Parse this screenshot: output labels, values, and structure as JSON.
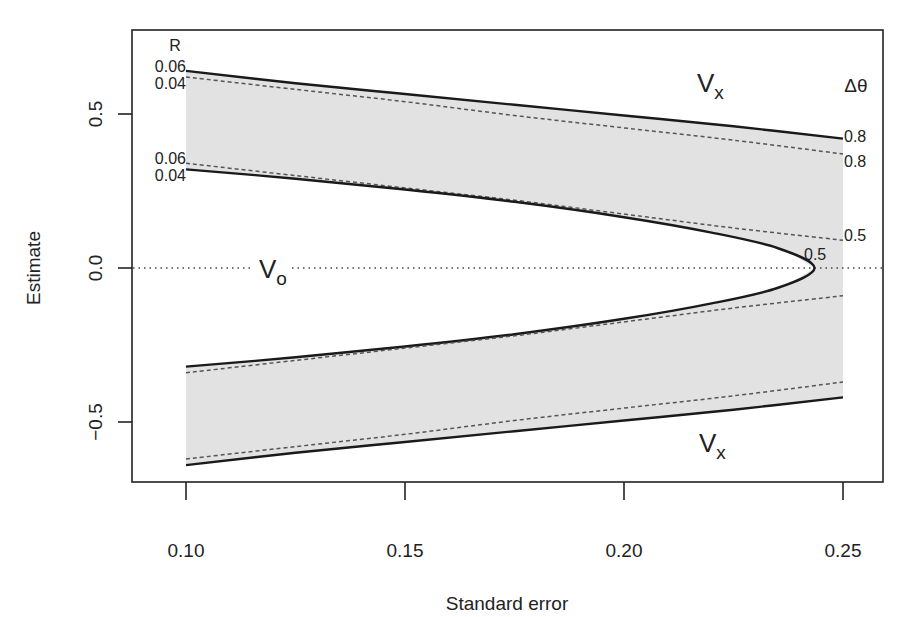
{
  "chart_data": {
    "type": "area",
    "title": "",
    "xlabel": "Standard error",
    "ylabel": "Estimate",
    "xlim": [
      0.088,
      0.259
    ],
    "ylim": [
      -0.69,
      0.77
    ],
    "x_ticks": [
      0.1,
      0.15,
      0.2,
      0.25
    ],
    "x_tick_labels": [
      "0.10",
      "0.15",
      "0.20",
      "0.25"
    ],
    "y_ticks": [
      0.5,
      0.0,
      -0.5
    ],
    "y_tick_labels": [
      "0.5",
      "0.0",
      "−0.5"
    ],
    "grid": false,
    "legend": null,
    "reference_line": {
      "y": 0.0,
      "style": "dotted"
    },
    "shaded_regions": [
      {
        "name": "upper band",
        "fill": "#e2e2e2",
        "between": [
          "outer solid upper",
          "inner solid upper"
        ]
      },
      {
        "name": "lower band",
        "fill": "#e2e2e2",
        "between": [
          "outer solid lower",
          "inner solid lower"
        ]
      }
    ],
    "series": [
      {
        "name": "outer solid upper (R=0.06, Δθ=0.8)",
        "style": "solid",
        "x": [
          0.1,
          0.125,
          0.15,
          0.175,
          0.2,
          0.225,
          0.25
        ],
        "y": [
          0.64,
          0.6,
          0.565,
          0.53,
          0.495,
          0.46,
          0.42
        ]
      },
      {
        "name": "outer dashed upper (R=0.04, Δθ=0.8)",
        "style": "dashed",
        "x": [
          0.1,
          0.125,
          0.15,
          0.175,
          0.2,
          0.225,
          0.25
        ],
        "y": [
          0.62,
          0.58,
          0.54,
          0.495,
          0.455,
          0.415,
          0.37
        ]
      },
      {
        "name": "inner dashed upper (R=0.06, Δθ=0.5)",
        "style": "dashed",
        "x": [
          0.1,
          0.125,
          0.15,
          0.175,
          0.2,
          0.225,
          0.25
        ],
        "y": [
          0.34,
          0.3,
          0.26,
          0.22,
          0.175,
          0.13,
          0.09
        ]
      },
      {
        "name": "inner solid upper (R=0.04, Δθ=0.5)",
        "style": "solid",
        "x": [
          0.1,
          0.125,
          0.15,
          0.175,
          0.2,
          0.22,
          0.235,
          0.2435
        ],
        "y": [
          0.32,
          0.29,
          0.255,
          0.215,
          0.165,
          0.115,
          0.065,
          0.0
        ]
      },
      {
        "name": "inner solid lower",
        "style": "solid",
        "x": [
          0.1,
          0.125,
          0.15,
          0.175,
          0.2,
          0.22,
          0.235,
          0.2435
        ],
        "y": [
          -0.32,
          -0.29,
          -0.255,
          -0.215,
          -0.165,
          -0.115,
          -0.065,
          0.0
        ]
      },
      {
        "name": "inner dashed lower",
        "style": "dashed",
        "x": [
          0.1,
          0.125,
          0.15,
          0.175,
          0.2,
          0.225,
          0.25
        ],
        "y": [
          -0.34,
          -0.3,
          -0.26,
          -0.22,
          -0.175,
          -0.13,
          -0.09
        ]
      },
      {
        "name": "outer dashed lower",
        "style": "dashed",
        "x": [
          0.1,
          0.125,
          0.15,
          0.175,
          0.2,
          0.225,
          0.25
        ],
        "y": [
          -0.62,
          -0.58,
          -0.54,
          -0.495,
          -0.455,
          -0.415,
          -0.37
        ]
      },
      {
        "name": "outer solid lower",
        "style": "solid",
        "x": [
          0.1,
          0.125,
          0.15,
          0.175,
          0.2,
          0.225,
          0.25
        ],
        "y": [
          -0.64,
          -0.6,
          -0.565,
          -0.53,
          -0.495,
          -0.46,
          -0.42
        ]
      }
    ],
    "annotations": {
      "R_header": "R",
      "R_labels": [
        "0.06",
        "0.04",
        "0.06",
        "0.04"
      ],
      "dtheta_header": "Δθ",
      "dtheta_labels": [
        "0.8",
        "0.8",
        "0.5",
        "0.5"
      ],
      "regions": [
        {
          "label": "V",
          "subscript": "x",
          "position": "upper right"
        },
        {
          "label": "V",
          "subscript": "o",
          "position": "center left"
        },
        {
          "label": "V",
          "subscript": "x",
          "position": "lower right"
        }
      ]
    }
  }
}
